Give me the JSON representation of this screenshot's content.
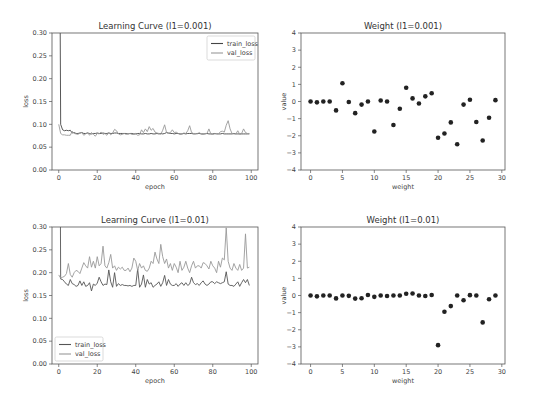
{
  "chart_data": [
    {
      "type": "line",
      "title": "Learning Curve (l1=0.001)",
      "xlabel": "epoch",
      "ylabel": "loss",
      "xlim": [
        -3.5,
        103.5
      ],
      "ylim": [
        0.0,
        0.3
      ],
      "xticks": [
        0,
        20,
        40,
        60,
        80,
        100
      ],
      "yticks": [
        0.0,
        0.05,
        0.1,
        0.15,
        0.2,
        0.25,
        0.3
      ],
      "ytick_labels": [
        "0.00",
        "0.05",
        "0.10",
        "0.15",
        "0.20",
        "0.25",
        "0.30"
      ],
      "legend": "top-right",
      "series": [
        {
          "name": "train_loss",
          "color": "#444444",
          "x_start": 0,
          "values": [
            0.95,
            0.1,
            0.088,
            0.086,
            0.087,
            0.086,
            0.087,
            0.081,
            0.082,
            0.08,
            0.08,
            0.081,
            0.082,
            0.08,
            0.08,
            0.081,
            0.08,
            0.079,
            0.08,
            0.08,
            0.081,
            0.08,
            0.08,
            0.081,
            0.08,
            0.08,
            0.081,
            0.08,
            0.08,
            0.081,
            0.081,
            0.08,
            0.08,
            0.08,
            0.08,
            0.08,
            0.079,
            0.08,
            0.08,
            0.079,
            0.079,
            0.08,
            0.08,
            0.079,
            0.079,
            0.08,
            0.079,
            0.079,
            0.08,
            0.079,
            0.079,
            0.08,
            0.079,
            0.08,
            0.079,
            0.08,
            0.082,
            0.081,
            0.08,
            0.08,
            0.079,
            0.08,
            0.08,
            0.079,
            0.079,
            0.08,
            0.079,
            0.08,
            0.08,
            0.08,
            0.079,
            0.079,
            0.08,
            0.08,
            0.079,
            0.079,
            0.079,
            0.08,
            0.079,
            0.079,
            0.079,
            0.08,
            0.079,
            0.079,
            0.079,
            0.08,
            0.079,
            0.079,
            0.079,
            0.079,
            0.079,
            0.08,
            0.079,
            0.079,
            0.079,
            0.079,
            0.079,
            0.079,
            0.079,
            0.079
          ]
        },
        {
          "name": "val_loss",
          "color": "#999999",
          "x_start": 0,
          "values": [
            0.1,
            0.08,
            0.077,
            0.077,
            0.076,
            0.076,
            0.076,
            0.085,
            0.08,
            0.079,
            0.078,
            0.081,
            0.082,
            0.076,
            0.079,
            0.082,
            0.076,
            0.082,
            0.078,
            0.074,
            0.08,
            0.079,
            0.083,
            0.078,
            0.08,
            0.076,
            0.082,
            0.077,
            0.081,
            0.089,
            0.086,
            0.079,
            0.077,
            0.078,
            0.08,
            0.078,
            0.079,
            0.08,
            0.078,
            0.078,
            0.08,
            0.076,
            0.077,
            0.088,
            0.082,
            0.09,
            0.084,
            0.095,
            0.087,
            0.091,
            0.083,
            0.081,
            0.08,
            0.078,
            0.087,
            0.099,
            0.082,
            0.08,
            0.082,
            0.088,
            0.082,
            0.083,
            0.08,
            0.078,
            0.079,
            0.081,
            0.08,
            0.086,
            0.097,
            0.082,
            0.08,
            0.08,
            0.079,
            0.082,
            0.079,
            0.078,
            0.08,
            0.08,
            0.09,
            0.079,
            0.078,
            0.079,
            0.08,
            0.079,
            0.084,
            0.085,
            0.083,
            0.098,
            0.108,
            0.09,
            0.08,
            0.079,
            0.079,
            0.086,
            0.078,
            0.08,
            0.09,
            0.082,
            0.08,
            0.08
          ]
        }
      ]
    },
    {
      "type": "scatter",
      "title": "Weight (l1=0.001)",
      "xlabel": "weight",
      "ylabel": "value",
      "xlim": [
        -1.5,
        30.5
      ],
      "ylim": [
        -4,
        4
      ],
      "xticks": [
        0,
        5,
        10,
        15,
        20,
        25,
        30
      ],
      "yticks": [
        -4,
        -3,
        -2,
        -1,
        0,
        1,
        2,
        3,
        4
      ],
      "ytick_labels": [
        "−4",
        "−3",
        "−2",
        "−1",
        "0",
        "1",
        "2",
        "3",
        "4"
      ],
      "color": "#222222",
      "x": [
        0,
        1,
        2,
        3,
        4,
        5,
        6,
        7,
        8,
        9,
        10,
        11,
        12,
        13,
        14,
        15,
        16,
        17,
        18,
        19,
        20,
        21,
        22,
        23,
        24,
        25,
        26,
        27,
        28,
        29
      ],
      "y": [
        0,
        -0.05,
        0,
        0,
        -0.52,
        1.07,
        -0.03,
        -0.68,
        -0.18,
        0,
        -1.75,
        0.06,
        0,
        -1.37,
        -0.42,
        0.8,
        0.18,
        -0.12,
        0.3,
        0.48,
        -2.12,
        -1.87,
        -1.22,
        -2.5,
        -0.18,
        0.1,
        -1.2,
        -2.28,
        -0.95,
        0.08
      ]
    },
    {
      "type": "line",
      "title": "Learning Curve (l1=0.01)",
      "xlabel": "epoch",
      "ylabel": "loss",
      "xlim": [
        -3.5,
        103.5
      ],
      "ylim": [
        0.0,
        0.3
      ],
      "xticks": [
        0,
        20,
        40,
        60,
        80,
        100
      ],
      "yticks": [
        0.0,
        0.05,
        0.1,
        0.15,
        0.2,
        0.25,
        0.3
      ],
      "ytick_labels": [
        "0.00",
        "0.05",
        "0.10",
        "0.15",
        "0.20",
        "0.25",
        "0.30"
      ],
      "legend": "bottom-left",
      "series": [
        {
          "name": "train_loss",
          "color": "#555555",
          "x_start": 0,
          "values": [
            1.2,
            0.186,
            0.185,
            0.18,
            0.175,
            0.172,
            0.185,
            0.176,
            0.174,
            0.17,
            0.172,
            0.182,
            0.172,
            0.18,
            0.17,
            0.172,
            0.178,
            0.16,
            0.175,
            0.172,
            0.177,
            0.19,
            0.18,
            0.172,
            0.175,
            0.174,
            0.206,
            0.18,
            0.168,
            0.2,
            0.17,
            0.176,
            0.172,
            0.174,
            0.172,
            0.172,
            0.171,
            0.172,
            0.17,
            0.172,
            0.172,
            0.208,
            0.168,
            0.175,
            0.195,
            0.168,
            0.185,
            0.175,
            0.178,
            0.168,
            0.172,
            0.175,
            0.18,
            0.17,
            0.178,
            0.194,
            0.172,
            0.185,
            0.175,
            0.172,
            0.172,
            0.176,
            0.17,
            0.175,
            0.178,
            0.172,
            0.178,
            0.172,
            0.175,
            0.19,
            0.178,
            0.174,
            0.176,
            0.172,
            0.178,
            0.182,
            0.175,
            0.172,
            0.175,
            0.18,
            0.18,
            0.176,
            0.18,
            0.178,
            0.176,
            0.178,
            0.18,
            0.202,
            0.175,
            0.172,
            0.172,
            0.17,
            0.175,
            0.18,
            0.17,
            0.178,
            0.185,
            0.178,
            0.185,
            0.172
          ]
        },
        {
          "name": "val_loss",
          "color": "#999999",
          "x_start": 0,
          "values": [
            0.195,
            0.188,
            0.19,
            0.192,
            0.198,
            0.22,
            0.196,
            0.19,
            0.2,
            0.205,
            0.203,
            0.198,
            0.21,
            0.222,
            0.215,
            0.21,
            0.235,
            0.212,
            0.225,
            0.21,
            0.235,
            0.215,
            0.22,
            0.258,
            0.215,
            0.21,
            0.222,
            0.24,
            0.21,
            0.215,
            0.205,
            0.212,
            0.208,
            0.212,
            0.205,
            0.205,
            0.21,
            0.202,
            0.21,
            0.232,
            0.225,
            0.205,
            0.22,
            0.21,
            0.215,
            0.205,
            0.203,
            0.21,
            0.225,
            0.22,
            0.245,
            0.23,
            0.22,
            0.262,
            0.235,
            0.22,
            0.23,
            0.21,
            0.22,
            0.205,
            0.22,
            0.212,
            0.2,
            0.225,
            0.205,
            0.212,
            0.225,
            0.21,
            0.2,
            0.215,
            0.225,
            0.21,
            0.215,
            0.215,
            0.21,
            0.222,
            0.22,
            0.215,
            0.208,
            0.225,
            0.215,
            0.21,
            0.2,
            0.225,
            0.212,
            0.232,
            0.228,
            0.298,
            0.225,
            0.21,
            0.205,
            0.22,
            0.21,
            0.205,
            0.218,
            0.205,
            0.21,
            0.285,
            0.21,
            0.212
          ]
        }
      ]
    },
    {
      "type": "scatter",
      "title": "Weight (l1=0.01)",
      "xlabel": "weight",
      "ylabel": "value",
      "xlim": [
        -1.5,
        30.5
      ],
      "ylim": [
        -4,
        4
      ],
      "xticks": [
        0,
        5,
        10,
        15,
        20,
        25,
        30
      ],
      "yticks": [
        -4,
        -3,
        -2,
        -1,
        0,
        1,
        2,
        3,
        4
      ],
      "ytick_labels": [
        "−4",
        "−3",
        "−2",
        "−1",
        "0",
        "1",
        "2",
        "3",
        "4"
      ],
      "color": "#222222",
      "x": [
        0,
        1,
        2,
        3,
        4,
        5,
        6,
        7,
        8,
        9,
        10,
        11,
        12,
        13,
        14,
        15,
        16,
        17,
        18,
        19,
        20,
        21,
        22,
        23,
        24,
        25,
        26,
        27,
        28,
        29
      ],
      "y": [
        0,
        -0.05,
        0,
        0,
        -0.17,
        0,
        -0.02,
        -0.18,
        -0.16,
        0.03,
        -0.08,
        0,
        -0.03,
        0,
        0,
        0.1,
        0.12,
        0,
        -0.03,
        0.03,
        -2.9,
        -0.95,
        -0.62,
        0,
        -0.28,
        0.02,
        0,
        -1.57,
        -0.22,
        0
      ]
    }
  ]
}
